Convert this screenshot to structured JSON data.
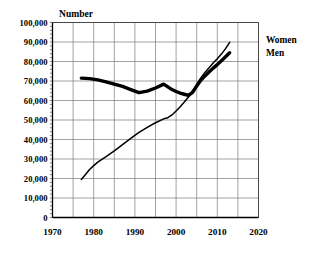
{
  "chart_data": {
    "type": "line",
    "title": "Number",
    "xlabel": "",
    "ylabel": "",
    "xlim": [
      1970,
      2020
    ],
    "ylim": [
      0,
      100000
    ],
    "grid": true,
    "legend_position": "right",
    "x_ticks": [
      1970,
      1980,
      1990,
      2000,
      2010,
      2020
    ],
    "x_tick_labels": [
      "1970",
      "1980",
      "1990",
      "2000",
      "2010",
      "2020"
    ],
    "x_minor_interval": 5,
    "y_ticks": [
      0,
      10000,
      20000,
      30000,
      40000,
      50000,
      60000,
      70000,
      80000,
      90000,
      100000
    ],
    "y_tick_labels": [
      "0",
      "10,000",
      "20,000",
      "30,000",
      "40,000",
      "50,000",
      "60,000",
      "70,000",
      "80,000",
      "90,000",
      "100,000"
    ],
    "series": [
      {
        "name": "Women",
        "style": "thin",
        "points": [
          [
            1977,
            19500
          ],
          [
            1978,
            22000
          ],
          [
            1979,
            24600
          ],
          [
            1980,
            26600
          ],
          [
            1981,
            28400
          ],
          [
            1983,
            31200
          ],
          [
            1985,
            34200
          ],
          [
            1987,
            37400
          ],
          [
            1989,
            40600
          ],
          [
            1991,
            43600
          ],
          [
            1993,
            46200
          ],
          [
            1995,
            48600
          ],
          [
            1997,
            50600
          ],
          [
            1998,
            51200
          ],
          [
            1999,
            52600
          ],
          [
            2000,
            54600
          ],
          [
            2001,
            56800
          ],
          [
            2002,
            59200
          ],
          [
            2003,
            61800
          ],
          [
            2004,
            64800
          ],
          [
            2005,
            68200
          ],
          [
            2006,
            71600
          ],
          [
            2007,
            74400
          ],
          [
            2008,
            76800
          ],
          [
            2009,
            79200
          ],
          [
            2010,
            81400
          ],
          [
            2011,
            83800
          ],
          [
            2012,
            86600
          ],
          [
            2013,
            89800
          ]
        ]
      },
      {
        "name": "Men",
        "style": "thick",
        "points": [
          [
            1977,
            71500
          ],
          [
            1979,
            71200
          ],
          [
            1981,
            70600
          ],
          [
            1983,
            69600
          ],
          [
            1985,
            68400
          ],
          [
            1987,
            67200
          ],
          [
            1989,
            65600
          ],
          [
            1991,
            64000
          ],
          [
            1993,
            64800
          ],
          [
            1995,
            66400
          ],
          [
            1997,
            68400
          ],
          [
            1998,
            67000
          ],
          [
            1999,
            65600
          ],
          [
            2000,
            64600
          ],
          [
            2001,
            63800
          ],
          [
            2002,
            63200
          ],
          [
            2003,
            62600
          ],
          [
            2004,
            64200
          ],
          [
            2005,
            67400
          ],
          [
            2006,
            70400
          ],
          [
            2007,
            72600
          ],
          [
            2008,
            74600
          ],
          [
            2009,
            76600
          ],
          [
            2010,
            78400
          ],
          [
            2011,
            80400
          ],
          [
            2012,
            82400
          ],
          [
            2013,
            84500
          ]
        ]
      }
    ],
    "legend_entries": [
      "Women",
      "Men"
    ]
  },
  "legend": {
    "women_label": "Women",
    "men_label": "Men"
  },
  "axes": {
    "y_title": "Number"
  }
}
